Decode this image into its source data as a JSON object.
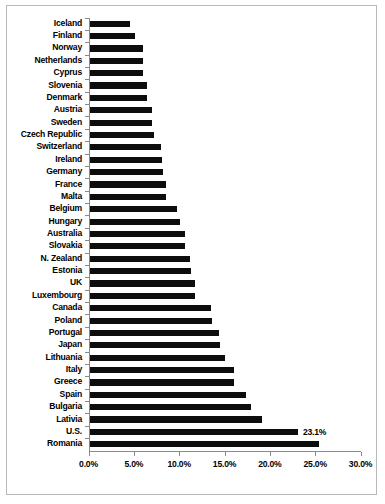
{
  "chart_data": {
    "type": "bar",
    "orientation": "horizontal",
    "title": "",
    "subtitle": "",
    "xlabel": "",
    "ylabel": "",
    "xlim": [
      0,
      30
    ],
    "grid": false,
    "legend": null,
    "bar_color": "#0d0d0d",
    "axis_color": "#8a8a8a",
    "x_tick_labels": [
      "0.0%",
      "5.0%",
      "10.0%",
      "15.0%",
      "20.0%",
      "25.0%",
      "30.0%"
    ],
    "x_tick_values": [
      0,
      5,
      10,
      15,
      20,
      25,
      30
    ],
    "categories": [
      "Iceland",
      "Finland",
      "Norway",
      "Netherlands",
      "Cyprus",
      "Slovenia",
      "Denmark",
      "Austria",
      "Sweden",
      "Czech Republic",
      "Switzerland",
      "Ireland",
      "Germany",
      "France",
      "Malta",
      "Belgium",
      "Hungary",
      "Australia",
      "Slovakia",
      "N. Zealand",
      "Estonia",
      "UK",
      "Luxembourg",
      "Canada",
      "Poland",
      "Portugal",
      "Japan",
      "Lithuania",
      "Italy",
      "Greece",
      "Spain",
      "Bulgaria",
      "Lativia",
      "U.S.",
      "Romania"
    ],
    "values": [
      4.6,
      5.1,
      6.0,
      6.0,
      6.0,
      6.4,
      6.4,
      7.0,
      7.0,
      7.2,
      8.0,
      8.1,
      8.2,
      8.5,
      8.6,
      9.8,
      10.1,
      10.6,
      10.6,
      11.2,
      11.3,
      11.8,
      11.8,
      13.5,
      13.6,
      14.4,
      14.5,
      15.1,
      16.1,
      16.1,
      17.4,
      17.9,
      19.1,
      23.1,
      25.4
    ],
    "annotations": [
      {
        "category": "U.S.",
        "text": "23.1%",
        "value": 23.1
      }
    ]
  }
}
